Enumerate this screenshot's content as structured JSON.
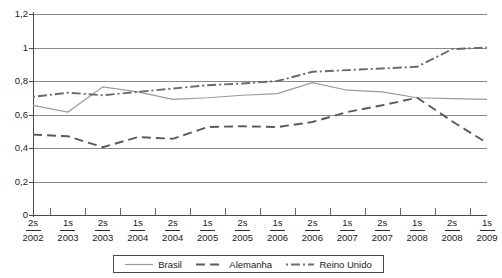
{
  "chart_data": {
    "type": "line",
    "title": "",
    "subtitle": "",
    "xlabel": "",
    "ylabel": "",
    "ylim": [
      0,
      1.2
    ],
    "y_ticks": [
      "0",
      "0,2",
      "0,4",
      "0,6",
      "0,8",
      "1",
      "1,2"
    ],
    "y_tick_values": [
      0,
      0.2,
      0.4,
      0.6,
      0.8,
      1.0,
      1.2
    ],
    "grid": true,
    "legend_position": "bottom",
    "decimal_separator": ",",
    "categories": [
      "2s 2002",
      "1s 2003",
      "2s 2003",
      "1s 2004",
      "2s 2004",
      "1s 2005",
      "2s 2005",
      "1s 2006",
      "2s 2006",
      "1s 2007",
      "2s 2007",
      "1s 2008",
      "2s 2008",
      "1s 2009"
    ],
    "x_tick_labels": [
      {
        "semester": "2s",
        "year": "2002"
      },
      {
        "semester": "1s",
        "year": "2003"
      },
      {
        "semester": "2s",
        "year": "2003"
      },
      {
        "semester": "1s",
        "year": "2004"
      },
      {
        "semester": "2s",
        "year": "2004"
      },
      {
        "semester": "1s",
        "year": "2005"
      },
      {
        "semester": "2s",
        "year": "2005"
      },
      {
        "semester": "1s",
        "year": "2006"
      },
      {
        "semester": "2s",
        "year": "2006"
      },
      {
        "semester": "1s",
        "year": "2007"
      },
      {
        "semester": "2s",
        "year": "2007"
      },
      {
        "semester": "1s",
        "year": "2008"
      },
      {
        "semester": "2s",
        "year": "2008"
      },
      {
        "semester": "1s",
        "year": "2009"
      }
    ],
    "series": [
      {
        "name": "Brasil",
        "style": "solid",
        "color": "#9a9a9a",
        "values": [
          0.655,
          0.615,
          0.765,
          0.735,
          0.69,
          0.7,
          0.715,
          0.725,
          0.79,
          0.745,
          0.735,
          0.7,
          0.695,
          0.69
        ]
      },
      {
        "name": "Alemanha",
        "style": "dashed",
        "color": "#5a5a5a",
        "values": [
          0.48,
          0.47,
          0.405,
          0.465,
          0.455,
          0.525,
          0.53,
          0.525,
          0.555,
          0.615,
          0.655,
          0.7,
          0.56,
          0.43
        ]
      },
      {
        "name": "Reino Unido",
        "style": "dash-dot",
        "color": "#6a6a6a",
        "values": [
          0.705,
          0.73,
          0.715,
          0.735,
          0.755,
          0.775,
          0.785,
          0.8,
          0.855,
          0.865,
          0.875,
          0.885,
          0.99,
          1.0
        ]
      }
    ]
  },
  "legend": {
    "items": [
      {
        "label": "Brasil",
        "swatch": "solid-line-swatch"
      },
      {
        "label": "Alemanha",
        "swatch": "dashed-line-swatch"
      },
      {
        "label": "Reino Unido",
        "swatch": "dash-dot-line-swatch"
      }
    ]
  }
}
